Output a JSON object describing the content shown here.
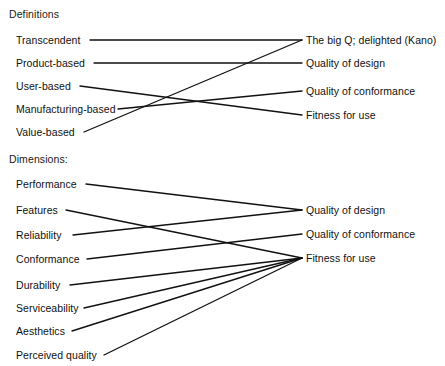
{
  "diagram": {
    "line_color": "#111111",
    "text_color": "#111111",
    "background_color": "#ffffff"
  },
  "sections": [
    {
      "id": "definitions",
      "heading": "Definitions",
      "left_nodes": [
        {
          "id": "transcendent",
          "label": "Transcendent"
        },
        {
          "id": "product-based",
          "label": "Product-based"
        },
        {
          "id": "user-based",
          "label": "User-based"
        },
        {
          "id": "manufacturing-based",
          "label": "Manufacturing-based"
        },
        {
          "id": "value-based",
          "label": "Value-based"
        }
      ],
      "right_nodes": [
        {
          "id": "big-q",
          "label": "The big Q; delighted (Kano)"
        },
        {
          "id": "quality-of-design",
          "label": "Quality of design"
        },
        {
          "id": "quality-of-conformance",
          "label": "Quality of conformance"
        },
        {
          "id": "fitness-for-use",
          "label": "Fitness for use"
        }
      ],
      "links": [
        {
          "from": "transcendent",
          "to": "big-q"
        },
        {
          "from": "product-based",
          "to": "quality-of-design"
        },
        {
          "from": "user-based",
          "to": "fitness-for-use"
        },
        {
          "from": "manufacturing-based",
          "to": "quality-of-conformance"
        },
        {
          "from": "value-based",
          "to": "big-q"
        }
      ]
    },
    {
      "id": "dimensions",
      "heading": "Dimensions:",
      "left_nodes": [
        {
          "id": "performance",
          "label": "Performance"
        },
        {
          "id": "features",
          "label": "Features"
        },
        {
          "id": "reliability",
          "label": "Reliability"
        },
        {
          "id": "conformance",
          "label": "Conformance"
        },
        {
          "id": "durability",
          "label": "Durability"
        },
        {
          "id": "serviceability",
          "label": "Serviceability"
        },
        {
          "id": "aesthetics",
          "label": "Aesthetics"
        },
        {
          "id": "perceived-quality",
          "label": "Perceived quality"
        }
      ],
      "right_nodes": [
        {
          "id": "quality-of-design-2",
          "label": "Quality of design"
        },
        {
          "id": "quality-of-conformance-2",
          "label": "Quality of conformance"
        },
        {
          "id": "fitness-for-use-2",
          "label": "Fitness for use"
        }
      ],
      "links": [
        {
          "from": "performance",
          "to": "quality-of-design-2"
        },
        {
          "from": "features",
          "to": "fitness-for-use-2"
        },
        {
          "from": "reliability",
          "to": "quality-of-design-2"
        },
        {
          "from": "conformance",
          "to": "quality-of-conformance-2"
        },
        {
          "from": "durability",
          "to": "fitness-for-use-2"
        },
        {
          "from": "serviceability",
          "to": "fitness-for-use-2"
        },
        {
          "from": "aesthetics",
          "to": "fitness-for-use-2"
        },
        {
          "from": "perceived-quality",
          "to": "fitness-for-use-2"
        }
      ]
    }
  ],
  "layout": {
    "headings": [
      {
        "section": "definitions",
        "x": 9,
        "y": 8
      },
      {
        "section": "dimensions",
        "x": 9,
        "y": 153
      }
    ],
    "left_label_x": 16,
    "right_label_x": 306,
    "definitions_left_points": [
      {
        "id": "transcendent",
        "ty": 35,
        "ex": 90,
        "ey": 40
      },
      {
        "id": "product-based",
        "ty": 58,
        "ex": 94,
        "ey": 63
      },
      {
        "id": "user-based",
        "ty": 81,
        "ex": 80,
        "ey": 86
      },
      {
        "id": "manufacturing-based",
        "ty": 104,
        "ex": 118,
        "ey": 109
      },
      {
        "id": "value-based",
        "ty": 127,
        "ex": 84,
        "ey": 132
      }
    ],
    "definitions_right_points": [
      {
        "id": "big-q",
        "ty": 35,
        "ex": 302,
        "ey": 40
      },
      {
        "id": "quality-of-design",
        "ty": 58,
        "ex": 302,
        "ey": 63
      },
      {
        "id": "quality-of-conformance",
        "ty": 86,
        "ex": 302,
        "ey": 91
      },
      {
        "id": "fitness-for-use",
        "ty": 110,
        "ex": 302,
        "ey": 115
      }
    ],
    "dimensions_left_points": [
      {
        "id": "performance",
        "ty": 179,
        "ex": 86,
        "ey": 184
      },
      {
        "id": "features",
        "ty": 205,
        "ex": 66,
        "ey": 210
      },
      {
        "id": "reliability",
        "ty": 230,
        "ex": 73,
        "ey": 235
      },
      {
        "id": "conformance",
        "ty": 254,
        "ex": 87,
        "ey": 259
      },
      {
        "id": "durability",
        "ty": 280,
        "ex": 70,
        "ey": 285
      },
      {
        "id": "serviceability",
        "ty": 303,
        "ex": 84,
        "ey": 308
      },
      {
        "id": "aesthetics",
        "ty": 326,
        "ex": 72,
        "ey": 331
      },
      {
        "id": "perceived-quality",
        "ty": 350,
        "ex": 104,
        "ey": 355
      }
    ],
    "dimensions_right_points": [
      {
        "id": "quality-of-design-2",
        "ty": 205,
        "ex": 302,
        "ey": 210
      },
      {
        "id": "quality-of-conformance-2",
        "ty": 229,
        "ex": 302,
        "ey": 234
      },
      {
        "id": "fitness-for-use-2",
        "ty": 253,
        "ex": 302,
        "ey": 258
      }
    ]
  }
}
